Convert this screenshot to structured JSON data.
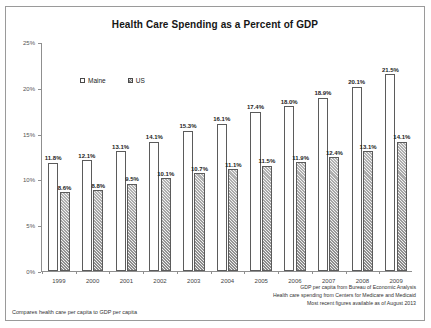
{
  "chart_data": {
    "type": "bar",
    "title": "Health Care Spending as a Percent of GDP",
    "xlabel": "",
    "ylabel": "",
    "ylim": [
      0,
      25
    ],
    "ytick_labels": [
      "0%",
      "5%",
      "10%",
      "15%",
      "20%",
      "25%"
    ],
    "ytick_values": [
      0,
      5,
      10,
      15,
      20,
      25
    ],
    "grid": false,
    "legend_position": "top-left",
    "categories": [
      "1999",
      "2000",
      "2001",
      "2002",
      "2003",
      "2004",
      "2005",
      "2006",
      "2007",
      "2008",
      "2009"
    ],
    "series": [
      {
        "name": "Maine",
        "values": [
          11.8,
          12.1,
          13.1,
          14.1,
          15.3,
          16.1,
          17.4,
          18.0,
          18.9,
          20.1,
          21.5
        ],
        "labels": [
          "11.8%",
          "12.1%",
          "13.1%",
          "14.1%",
          "15.3%",
          "16.1%",
          "17.4%",
          "18.0%",
          "18.9%",
          "20.1%",
          "21.5%"
        ]
      },
      {
        "name": "US",
        "values": [
          8.6,
          8.8,
          9.5,
          10.1,
          10.7,
          11.1,
          11.5,
          11.9,
          12.4,
          13.1,
          14.1
        ],
        "labels": [
          "8.6%",
          "8.8%",
          "9.5%",
          "10.1%",
          "10.7%",
          "11.1%",
          "11.5%",
          "11.9%",
          "12.4%",
          "13.1%",
          "14.1%"
        ]
      }
    ]
  },
  "legend": {
    "maine_label": "Maine",
    "us_label": "US"
  },
  "footnotes": {
    "left": "Compares health care per capita to GDP per capita",
    "right": [
      "GDP per capita from Bureau of Economic Analysis",
      "Health care spending from Centers for Medicare and Medicaid",
      "Most recent figures available as of August 2013"
    ]
  }
}
